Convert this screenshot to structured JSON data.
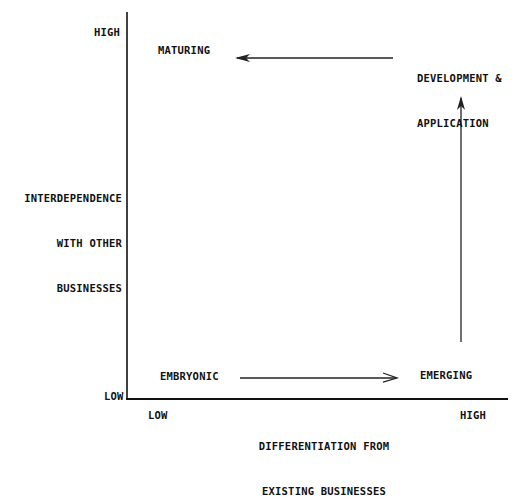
{
  "diagram": {
    "y_axis": {
      "label_lines": [
        "INTERDEPENDENCE",
        "WITH OTHER",
        "BUSINESSES"
      ],
      "high": "HIGH",
      "low": "LOW"
    },
    "x_axis": {
      "label_lines": [
        "DIFFERENTIATION FROM",
        "EXISTING BUSINESSES"
      ],
      "low": "LOW",
      "high": "HIGH"
    },
    "stages": {
      "embryonic": "EMBRYONIC",
      "emerging": "EMERGING",
      "development_lines": [
        "DEVELOPMENT &",
        "APPLICATION"
      ],
      "maturing": "MATURING"
    },
    "flow": [
      {
        "from": "EMBRYONIC",
        "to": "EMERGING",
        "direction": "right"
      },
      {
        "from": "EMERGING",
        "to": "DEVELOPMENT & APPLICATION",
        "direction": "up"
      },
      {
        "from": "DEVELOPMENT & APPLICATION",
        "to": "MATURING",
        "direction": "left"
      }
    ],
    "colors": {
      "ink": "#111111",
      "background": "#ffffff"
    }
  }
}
